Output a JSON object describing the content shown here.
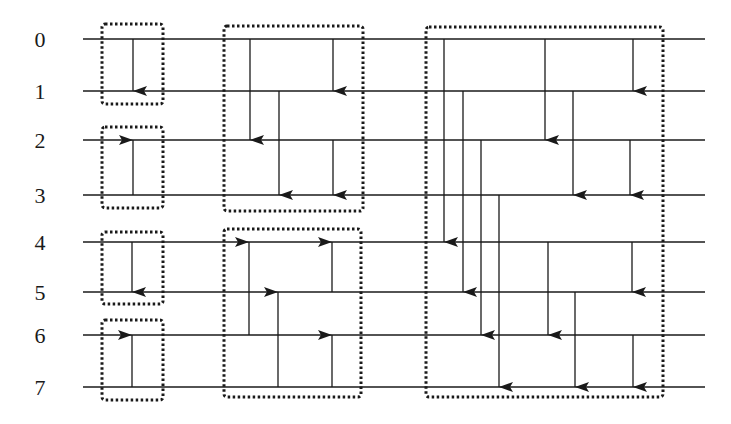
{
  "diagram": {
    "type": "bitonic-sorting-network",
    "wire_labels": [
      "0",
      "1",
      "2",
      "3",
      "4",
      "5",
      "6",
      "7"
    ],
    "wire_y": [
      39,
      91,
      140,
      195,
      242,
      292,
      335,
      387
    ],
    "wire_x_start": 83,
    "wire_x_end": 705,
    "label_x": 40,
    "colors": {
      "line": "#1a1a1a",
      "box": "#1a1a1a",
      "background": "#ffffff"
    },
    "boxes": [
      {
        "name": "stage1-box-0-1",
        "x": 102,
        "y": 24,
        "w": 61,
        "h": 80
      },
      {
        "name": "stage1-box-2-3",
        "x": 102,
        "y": 127,
        "w": 61,
        "h": 81
      },
      {
        "name": "stage1-box-4-5",
        "x": 102,
        "y": 232,
        "w": 61,
        "h": 72
      },
      {
        "name": "stage1-box-6-7",
        "x": 102,
        "y": 320,
        "w": 61,
        "h": 80
      },
      {
        "name": "stage2-box-top",
        "x": 224,
        "y": 26,
        "w": 139,
        "h": 185
      },
      {
        "name": "stage2-box-bottom",
        "x": 224,
        "y": 229,
        "w": 137,
        "h": 168
      },
      {
        "name": "stage3-box",
        "x": 426,
        "y": 27,
        "w": 237,
        "h": 370
      }
    ],
    "comparators": [
      {
        "x": 133,
        "from": 0,
        "to": 1
      },
      {
        "x": 133,
        "from": 3,
        "to": 2
      },
      {
        "x": 132,
        "from": 4,
        "to": 5
      },
      {
        "x": 132,
        "from": 7,
        "to": 6
      },
      {
        "x": 250,
        "from": 0,
        "to": 2
      },
      {
        "x": 333,
        "from": 0,
        "to": 1
      },
      {
        "x": 279,
        "from": 1,
        "to": 3
      },
      {
        "x": 333,
        "from": 2,
        "to": 3
      },
      {
        "x": 249,
        "from": 6,
        "to": 4
      },
      {
        "x": 332,
        "from": 5,
        "to": 4
      },
      {
        "x": 278,
        "from": 7,
        "to": 5
      },
      {
        "x": 332,
        "from": 7,
        "to": 6
      },
      {
        "x": 444,
        "from": 0,
        "to": 4
      },
      {
        "x": 463,
        "from": 1,
        "to": 5
      },
      {
        "x": 481,
        "from": 2,
        "to": 6
      },
      {
        "x": 499,
        "from": 3,
        "to": 7
      },
      {
        "x": 545,
        "from": 0,
        "to": 2
      },
      {
        "x": 573,
        "from": 1,
        "to": 3
      },
      {
        "x": 548,
        "from": 4,
        "to": 6
      },
      {
        "x": 575,
        "from": 5,
        "to": 7
      },
      {
        "x": 633,
        "from": 0,
        "to": 1
      },
      {
        "x": 630,
        "from": 2,
        "to": 3
      },
      {
        "x": 632,
        "from": 4,
        "to": 5
      },
      {
        "x": 633,
        "from": 6,
        "to": 7
      }
    ]
  }
}
